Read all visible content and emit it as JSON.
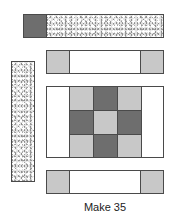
{
  "diagram": {
    "caption": "Make 35",
    "colors": {
      "dark": "#6e6e6e",
      "light": "#c8c8c8",
      "white": "#ffffff",
      "outline": "#4a4a4a"
    },
    "pieces": [
      {
        "id": "top-strip",
        "description": "dark square + print strip"
      },
      {
        "id": "sashing-top",
        "description": "light square, white strip, light square"
      },
      {
        "id": "vertical-print-strip",
        "description": "vertical print strip"
      },
      {
        "id": "nine-patch-block",
        "description": "white side strips with 3x3 nine-patch of light and dark squares"
      },
      {
        "id": "sashing-bottom",
        "description": "light square, white strip, light square"
      }
    ],
    "nine_patch": [
      [
        "light",
        "dark",
        "light"
      ],
      [
        "dark",
        "light",
        "dark"
      ],
      [
        "light",
        "dark",
        "light"
      ]
    ]
  }
}
